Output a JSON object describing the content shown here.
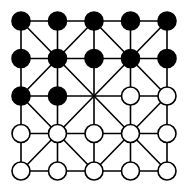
{
  "game": {
    "name": "Alquerque",
    "grid_size": 5,
    "colors": {
      "background": "#ffffff",
      "line": "#000000",
      "black_piece": "#000000",
      "white_piece": "#ffffff"
    },
    "board": [
      [
        "B",
        "B",
        "B",
        "B",
        "B"
      ],
      [
        "B",
        "B",
        "B",
        "B",
        "B"
      ],
      [
        "B",
        "B",
        "E",
        "W",
        "W"
      ],
      [
        "W",
        "W",
        "W",
        "W",
        "W"
      ],
      [
        "W",
        "W",
        "W",
        "W",
        "W"
      ]
    ],
    "legend": {
      "B": "black piece",
      "W": "white piece",
      "E": "empty point"
    }
  }
}
